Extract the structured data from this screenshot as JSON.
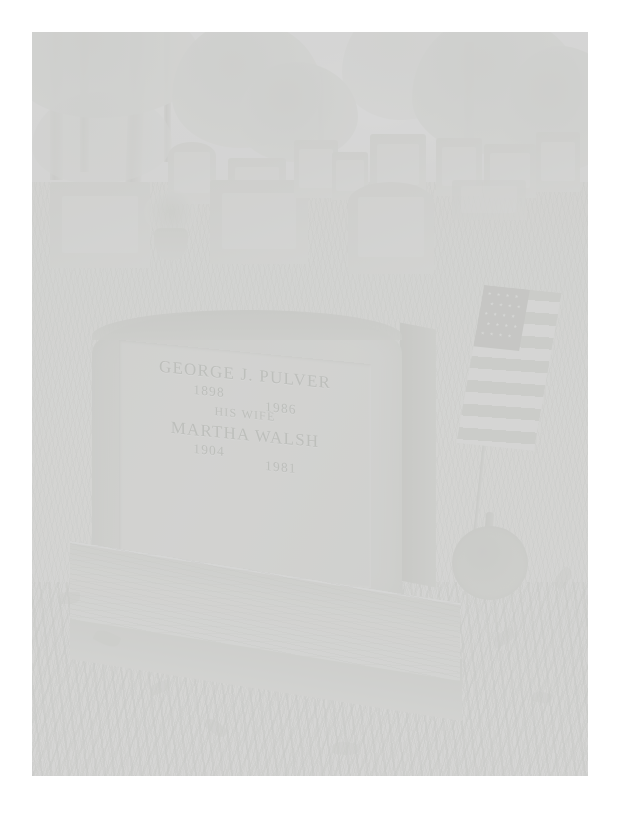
{
  "image": {
    "kind": "photograph",
    "subject": "cemetery-headstone",
    "tone": "heavily faded black and white print",
    "border_color": "#ffffff",
    "photo_left": 32,
    "photo_top": 32,
    "photo_width": 556,
    "photo_height": 744
  },
  "headstone": {
    "label": "granite-headstone",
    "shape": "arched-top",
    "inscription": {
      "name_primary": "GEORGE J. PULVER",
      "birth_primary": "1898",
      "death_primary": "1986",
      "relation": "HIS WIFE",
      "name_secondary": "MARTHA WALSH",
      "birth_secondary": "1904",
      "death_secondary": "1981"
    },
    "base_label": "granite-plinth-base"
  },
  "flag": {
    "label": "american-flag",
    "stripe_count": 13,
    "star_rows": 5,
    "stars_per_row": 5,
    "pole_label": "flag-pole",
    "marker_label": "veteran-grave-marker-disc"
  },
  "background": {
    "stones": [
      {
        "label": "background-headstone-1"
      },
      {
        "label": "background-headstone-2"
      },
      {
        "label": "background-headstone-3"
      },
      {
        "label": "background-headstone-4"
      },
      {
        "label": "background-headstone-5"
      },
      {
        "label": "background-headstone-6"
      },
      {
        "label": "background-headstone-7"
      },
      {
        "label": "background-headstone-8"
      },
      {
        "label": "background-headstone-9"
      },
      {
        "label": "background-headstone-10"
      },
      {
        "label": "background-headstone-11"
      },
      {
        "label": "background-headstone-12"
      }
    ],
    "urn_label": "flower-urn",
    "trees_label": "tree-canopy",
    "ground_label": "grass-ground"
  },
  "colors": {
    "paper_white": "#ffffff",
    "stone_light": "#e6e8e0",
    "stone_mid": "#d6d8cf",
    "stone_dark": "#c2c5ba",
    "engrave_text": "#9aa092",
    "foliage": "#d9ddd4",
    "ground": "#f0f1ea"
  }
}
